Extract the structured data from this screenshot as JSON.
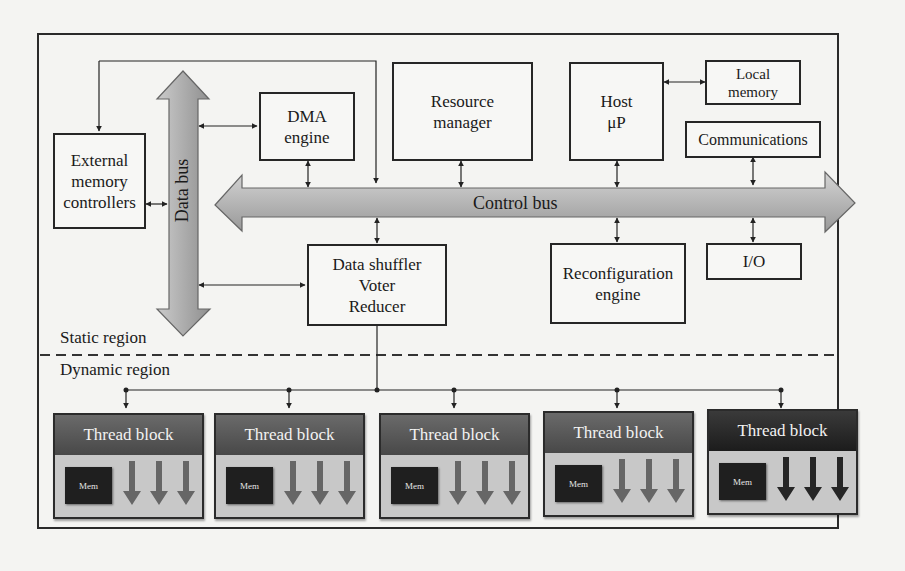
{
  "diagram": {
    "type": "block-architecture",
    "boxes": {
      "external_memory": "External\nmemory\ncontrollers",
      "dma": "DMA\nengine",
      "resource_manager": "Resource\nmanager",
      "host": "Host\nμP",
      "local_memory": "Local\nmemory",
      "communications": "Communications",
      "io": "I/O",
      "reconfiguration": "Reconfiguration\nengine",
      "shuffler": "Data shuffler\nVoter\nReducer"
    },
    "buses": {
      "data_bus": "Data bus",
      "control_bus": "Control bus"
    },
    "regions": {
      "static": "Static region",
      "dynamic": "Dynamic region"
    },
    "thread_blocks": [
      {
        "title": "Thread block",
        "mem": "Mem",
        "style": "medium"
      },
      {
        "title": "Thread block",
        "mem": "Mem",
        "style": "medium"
      },
      {
        "title": "Thread block",
        "mem": "Mem",
        "style": "medium"
      },
      {
        "title": "Thread block",
        "mem": "Mem",
        "style": "medium"
      },
      {
        "title": "Thread block",
        "mem": "Mem",
        "style": "dark"
      }
    ],
    "colors": {
      "bus_fill": "#b8b8b8",
      "bus_stroke": "#555555",
      "thread_header": "#555555",
      "thread_header_dark": "#252525",
      "thread_body": "#c8c8c8",
      "mem_fill": "#1f1f1f"
    }
  }
}
